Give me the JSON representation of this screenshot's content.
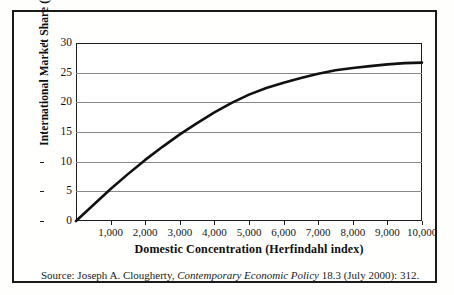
{
  "figure": {
    "border_color": "#1a1a1a",
    "background": "#fffffe"
  },
  "source": {
    "prefix": "Source: Joseph A. Clougherty, ",
    "journal": "Contemporary Economic Policy",
    "suffix": " 18.3 (July 2000): 312."
  },
  "chart_data": {
    "type": "line",
    "title": "",
    "xlabel": "Domestic Concentration (Herfindahl index)",
    "ylabel": "International Market Share (%)",
    "xlim": [
      0,
      10000
    ],
    "ylim": [
      0,
      30
    ],
    "grid": true,
    "legend": false,
    "line_color": "#111111",
    "line_width": 2.6,
    "xticks": [
      1000,
      2000,
      3000,
      4000,
      5000,
      6000,
      7000,
      8000,
      9000,
      10000
    ],
    "xtick_labels": [
      "1,000",
      "2,000",
      "3,000",
      "4,000",
      "5,000",
      "6,000",
      "7,000",
      "8,000",
      "9,000",
      "10,000"
    ],
    "yticks": [
      0,
      5,
      10,
      15,
      20,
      25,
      30
    ],
    "ytick_labels": [
      "0",
      "5",
      "10",
      "15",
      "20",
      "25",
      "30"
    ],
    "series": [
      {
        "name": "International Market Share",
        "x": [
          0,
          500,
          1000,
          1500,
          2000,
          2500,
          3000,
          3500,
          4000,
          4500,
          5000,
          5500,
          6000,
          6500,
          7000,
          7500,
          8000,
          8500,
          9000,
          9500,
          10000
        ],
        "y": [
          0.0,
          2.7,
          5.4,
          7.9,
          10.3,
          12.5,
          14.6,
          16.5,
          18.3,
          19.9,
          21.3,
          22.4,
          23.3,
          24.1,
          24.8,
          25.4,
          25.8,
          26.1,
          26.4,
          26.6,
          26.7
        ]
      }
    ]
  }
}
